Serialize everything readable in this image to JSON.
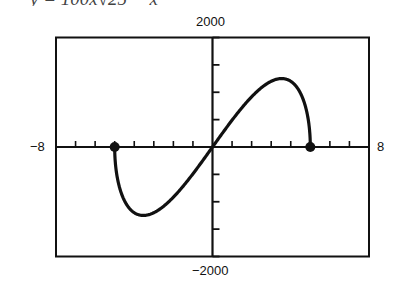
{
  "header": {
    "equation_partial": "y = 100x√25 − x²"
  },
  "labels": {
    "ymax": "2000",
    "ymin": "−2000",
    "xmin": "−8",
    "xmax": "8"
  },
  "colors": {
    "ink": "#111111",
    "background": "#ffffff"
  },
  "chart_data": {
    "type": "line",
    "xlabel": "",
    "ylabel": "",
    "xlim": [
      -8,
      8
    ],
    "ylim": [
      -2000,
      2000
    ],
    "x_tick_step": 1,
    "y_tick_step": 500,
    "tick_labels": {
      "x": [
        "-8",
        "8"
      ],
      "y": [
        "2000",
        "-2000"
      ]
    },
    "grid": false,
    "legend": null,
    "endpoints": [
      {
        "x": -5,
        "y": 0,
        "marker": "filled-circle"
      },
      {
        "x": 5,
        "y": 0,
        "marker": "filled-circle"
      }
    ],
    "extrema": [
      {
        "x": -3.54,
        "y": -1250,
        "kind": "min"
      },
      {
        "x": 3.54,
        "y": 1250,
        "kind": "max"
      }
    ],
    "series": [
      {
        "name": "f(x)",
        "x": [
          -5,
          -4.9,
          -4.75,
          -4.5,
          -4.25,
          -4,
          -3.75,
          -3.54,
          -3.25,
          -3,
          -2.5,
          -2,
          -1.5,
          -1,
          -0.5,
          0,
          0.5,
          1,
          1.5,
          2,
          2.5,
          3,
          3.25,
          3.54,
          3.75,
          4,
          4.25,
          4.5,
          4.75,
          4.9,
          5
        ],
        "values": [
          0,
          -487,
          -742,
          -981,
          -1120,
          -1200,
          -1240,
          -1250,
          -1235,
          -1200,
          -1083,
          -917,
          -715,
          -490,
          -249,
          0,
          249,
          490,
          715,
          917,
          1083,
          1200,
          1235,
          1250,
          1240,
          1200,
          1120,
          981,
          742,
          487,
          0
        ]
      }
    ]
  }
}
